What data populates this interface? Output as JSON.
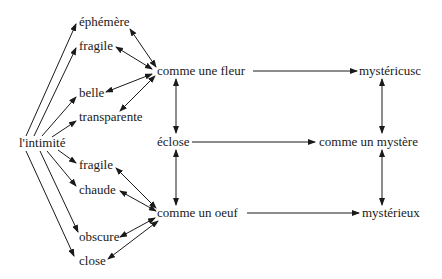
{
  "nodes": {
    "intimite": "l'intimité",
    "ephemere": "éphémère",
    "fragile_top": "fragile",
    "belle": "belle",
    "transparente": "transparente",
    "fragile_bottom": "fragile",
    "chaude": "chaude",
    "obscure": "obscure",
    "close": "close",
    "comme_une_fleur": "comme une fleur",
    "eclose": "éclose",
    "comme_un_oeuf": "comme un oeuf",
    "mysterieuse": "mystéricusc",
    "comme_un_mystere": "comme un mystère",
    "mysterieux": "mystérieux"
  },
  "colors": {
    "ink": "#1a1a1a",
    "background": "#ffffff"
  }
}
